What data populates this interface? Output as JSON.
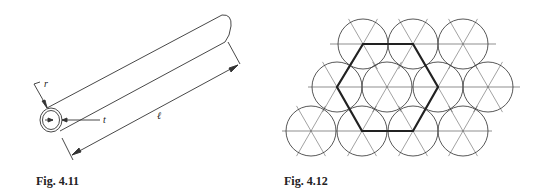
{
  "figures": [
    {
      "id": "fig-4-11",
      "caption": "Fig. 4.11",
      "description": "Thin-walled tube with radius r, wall thickness t, and length l",
      "labels": {
        "radius": "r",
        "thickness": "t",
        "length": "ℓ"
      }
    },
    {
      "id": "fig-4-12",
      "caption": "Fig. 4.12",
      "description": "Hexagonal close packing of circles with a highlighted hexagonal unit cell",
      "circles": [
        {
          "cx": 363,
          "cy": 44
        },
        {
          "cx": 413,
          "cy": 44
        },
        {
          "cx": 463,
          "cy": 44
        },
        {
          "cx": 337,
          "cy": 87
        },
        {
          "cx": 387,
          "cy": 87
        },
        {
          "cx": 438,
          "cy": 87
        },
        {
          "cx": 488,
          "cy": 87
        },
        {
          "cx": 311,
          "cy": 131
        },
        {
          "cx": 362,
          "cy": 131
        },
        {
          "cx": 413,
          "cy": 131
        },
        {
          "cx": 463,
          "cy": 131
        }
      ],
      "radius": 25,
      "hexagon": "363,44 413,44 438,87 413,131 362,131 337,87"
    }
  ]
}
